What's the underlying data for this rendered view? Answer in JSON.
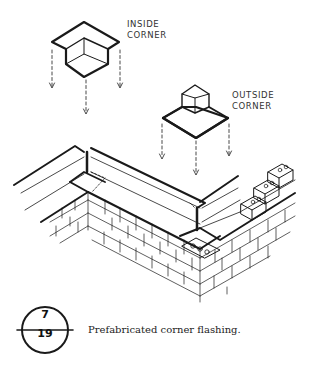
{
  "labels": {
    "inside_corner": [
      "INSIDE",
      "CORNER"
    ],
    "outside_corner": [
      "OUTSIDE",
      "CORNER"
    ]
  },
  "figure_reference": {
    "number": "7",
    "sheet": "19"
  },
  "caption": "Prefabricated corner flashing.",
  "colors": {
    "ink": "#1a1a1a",
    "background": "#ffffff"
  }
}
